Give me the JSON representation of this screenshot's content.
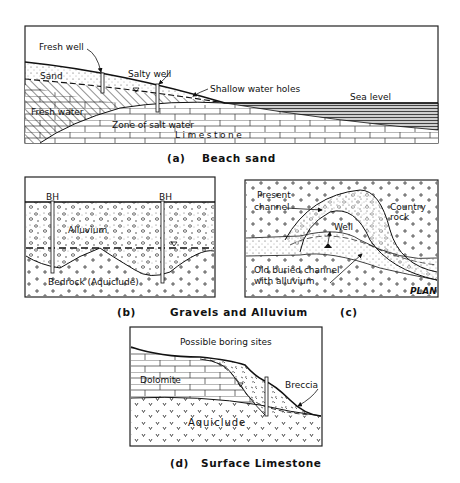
{
  "panels": {
    "a": {
      "labels": {
        "fresh_well": "Fresh well",
        "salty_well": "Salty well",
        "shallow_water_holes": "Shallow water holes",
        "sea_level": "Sea level",
        "sand": "Sand",
        "fresh_water": "Fresh water",
        "zone_salt_water": "Zone of salt water",
        "limestone": "Limestone"
      },
      "caption_letter": "(a)",
      "caption": "Beach sand"
    },
    "b": {
      "labels": {
        "bh_left": "BH",
        "bh_right": "BH",
        "alluvium": "Alluvium",
        "bedrock": "Bedrock (Aquiclude)"
      },
      "caption_letter": "(b)"
    },
    "c": {
      "labels": {
        "present_channel_1": "Present",
        "present_channel_2": "channel",
        "country_rock_1": "Country",
        "country_rock_2": "rock",
        "well": "Well",
        "old_channel_1": "Old buried channel",
        "old_channel_2": "with alluvium",
        "plan": "PLAN"
      },
      "caption_letter": "(c)"
    },
    "bc_caption": "Gravels and Alluvium",
    "d": {
      "labels": {
        "possible_boring_sites": "Possible boring sites",
        "dolomite": "Dolomite",
        "breccia": "Breccia",
        "aquiclude": "Aquiclude"
      },
      "caption_letter": "(d)",
      "caption": "Surface Limestone"
    }
  }
}
